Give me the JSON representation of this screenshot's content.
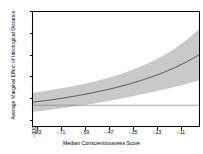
{
  "chart_data": {
    "type": "line",
    "title": "",
    "xlabel": "Median Conscientiousness Score",
    "ylabel": "Average Marginal Effect of Ideological Distance",
    "xlim": [
      -0.89,
      -0.05
    ],
    "ylim": [
      -0.0001,
      0.00045
    ],
    "xticks": [
      -0.83,
      -0.71,
      -0.59,
      -0.47,
      -0.35,
      -0.23,
      -0.11
    ],
    "xticklabels": [
      "-.83",
      "-.71",
      "-.59",
      "-.47",
      "-.35",
      "-.23",
      "-.11"
    ],
    "yticks": [
      -0.0001,
      0,
      0.0001,
      0.0002,
      0.0003,
      0.0004
    ],
    "yticklabels": [
      "-.0001",
      "0",
      ".0001",
      ".0002",
      ".0003",
      ".0004"
    ],
    "grid": false,
    "legend": "none",
    "zero_line": 0,
    "x": [
      -0.89,
      -0.83,
      -0.77,
      -0.71,
      -0.65,
      -0.59,
      -0.53,
      -0.47,
      -0.41,
      -0.35,
      -0.29,
      -0.23,
      -0.17,
      -0.11,
      -0.05
    ],
    "series": [
      {
        "name": "Average Marginal Effect",
        "values": [
          1.5e-05,
          2.2e-05,
          3e-05,
          3.9e-05,
          4.9e-05,
          6e-05,
          7.2e-05,
          8.55e-05,
          0.0001005,
          0.0001175,
          0.0001365,
          0.000158,
          0.0001825,
          0.0002105,
          0.000243
        ]
      },
      {
        "name": "95% CI upper",
        "values": [
          6.1e-05,
          6.9e-05,
          7.8e-05,
          8.8e-05,
          9.95e-05,
          0.0001125,
          0.000127,
          0.0001435,
          0.0001625,
          0.0001845,
          0.00021,
          0.00024,
          0.0002755,
          0.0003175,
          0.000367
        ]
      },
      {
        "name": "95% CI lower",
        "values": [
          -3.1e-05,
          -2.5e-05,
          -1.8e-05,
          -1e-05,
          -1.5e-06,
          7.5e-06,
          1.7e-05,
          2.75e-05,
          3.85e-05,
          5.05e-05,
          6.3e-05,
          7.6e-05,
          8.95e-05,
          0.0001035,
          0.000119
        ]
      }
    ],
    "colors": {
      "line": "#4d4d4d",
      "band": "#c9c9c9",
      "frame": "#000000",
      "zero_line": "#808080",
      "background": "#ffffff"
    }
  }
}
